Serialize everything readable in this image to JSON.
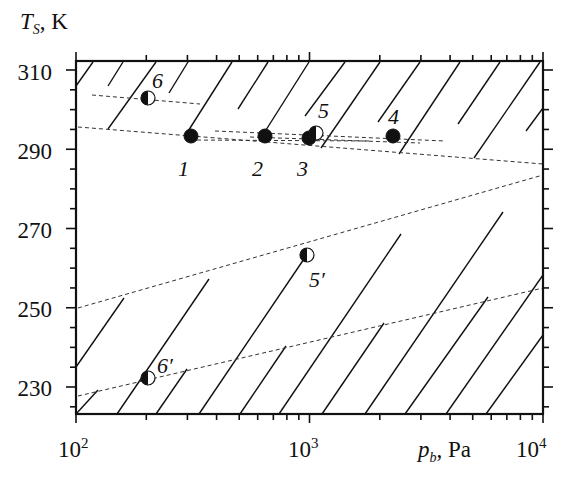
{
  "chart_data": {
    "type": "scatter",
    "title": "",
    "xlabel": "p_b, Pa",
    "xlabel_main": "p",
    "xlabel_sub": "b",
    "xlabel_unit": ", Pa",
    "ylabel": "T_S, K",
    "ylabel_main": "T",
    "ylabel_sub": "S",
    "ylabel_unit": ", K",
    "xscale": "log",
    "xlim": [
      100,
      10000
    ],
    "ylim": [
      223,
      313
    ],
    "x_ticks": [
      {
        "base": "10",
        "exp": "2",
        "value": 100
      },
      {
        "base": "10",
        "exp": "3",
        "value": 1000
      },
      {
        "base": "10",
        "exp": "4",
        "value": 10000
      }
    ],
    "y_ticks": [
      "230",
      "250",
      "270",
      "290",
      "310"
    ],
    "grid": false,
    "legend": null,
    "points": [
      {
        "label": "1",
        "p": 310,
        "T": 293.3,
        "marker": "filled"
      },
      {
        "label": "2",
        "p": 650,
        "T": 293.3,
        "marker": "filled"
      },
      {
        "label": "3",
        "p": 990,
        "T": 293.0,
        "marker": "filled"
      },
      {
        "label": "4",
        "p": 2300,
        "T": 293.3,
        "marker": "filled"
      },
      {
        "label": "5",
        "p": 1070,
        "T": 294.3,
        "marker": "half"
      },
      {
        "label": "6",
        "p": 200,
        "T": 303.6,
        "marker": "half"
      },
      {
        "label": "5′",
        "p": 1000,
        "T": 262.8,
        "marker": "half"
      },
      {
        "label": "6′",
        "p": 200,
        "T": 232.4,
        "marker": "half"
      }
    ],
    "dashed_lines": [
      {
        "name": "upper-boundary",
        "from": {
          "p": 100,
          "T": 297.5
        },
        "to": {
          "p": 10000,
          "T": 288.1
        }
      },
      {
        "name": "line-through-6",
        "from": {
          "p": 115,
          "T": 304.1
        },
        "to": {
          "p": 330,
          "T": 301.8
        }
      },
      {
        "name": "points-1-4-fit-a",
        "from": {
          "p": 530,
          "T": 294.6
        },
        "to": {
          "p": 3000,
          "T": 292.0
        }
      },
      {
        "name": "points-1-4-fit-b",
        "from": {
          "p": 195,
          "T": 293.6
        },
        "to": {
          "p": 1500,
          "T": 291.5
        }
      },
      {
        "name": "line-through-5prime",
        "from": {
          "p": 100,
          "T": 250.1
        },
        "to": {
          "p": 10000,
          "T": 277.1
        }
      },
      {
        "name": "line-through-6prime",
        "from": {
          "p": 100,
          "T": 227.6
        },
        "to": {
          "p": 10000,
          "T": 255.2
        }
      }
    ],
    "hatched_regions": [
      "above upper-boundary line",
      "below line-through-5prime"
    ]
  },
  "layout": {
    "plot_px": {
      "left": 76,
      "right": 543,
      "top": 61,
      "bottom": 414
    },
    "y_px": {
      "310": 70,
      "290": 149,
      "270": 229,
      "250": 308,
      "230": 387
    }
  },
  "hatch_segments_px": [
    [
      76,
      86,
      93,
      62
    ],
    [
      108,
      86,
      123,
      62
    ],
    [
      108,
      129,
      156,
      62
    ],
    [
      169,
      93,
      188,
      62
    ],
    [
      185,
      136,
      232,
      62
    ],
    [
      238,
      109,
      268,
      62
    ],
    [
      259,
      141,
      309,
      62
    ],
    [
      305,
      116,
      345,
      62
    ],
    [
      321,
      148,
      380,
      62
    ],
    [
      378,
      122,
      420,
      62
    ],
    [
      399,
      154,
      460,
      62
    ],
    [
      458,
      124,
      500,
      62
    ],
    [
      474,
      158,
      540,
      62
    ],
    [
      526,
      131,
      543,
      108
    ],
    [
      76,
      367,
      124,
      298
    ],
    [
      76,
      414,
      98,
      390
    ],
    [
      117,
      414,
      209,
      279
    ],
    [
      156,
      414,
      187,
      369
    ],
    [
      199,
      414,
      306,
      256
    ],
    [
      240,
      414,
      286,
      346
    ],
    [
      279,
      414,
      401,
      234
    ],
    [
      322,
      414,
      384,
      323
    ],
    [
      365,
      414,
      503,
      212
    ],
    [
      405,
      414,
      488,
      297
    ],
    [
      446,
      414,
      543,
      275
    ],
    [
      486,
      414,
      543,
      335
    ]
  ],
  "dash_segments_px": [
    [
      78,
      127,
      543,
      164
    ],
    [
      92,
      95,
      200,
      104
    ],
    [
      215,
      131,
      445,
      141
    ],
    [
      190,
      140,
      370,
      141
    ],
    [
      250,
      137,
      420,
      143
    ],
    [
      78,
      308,
      543,
      175
    ],
    [
      78,
      396,
      543,
      288
    ]
  ],
  "point_px": [
    {
      "label": "1",
      "x": 191,
      "y": 136,
      "marker": "filled",
      "lx": 178,
      "ly": 176
    },
    {
      "label": "2",
      "x": 265,
      "y": 136,
      "marker": "filled",
      "lx": 252,
      "ly": 176
    },
    {
      "label": "3",
      "x": 309,
      "y": 138,
      "marker": "filled",
      "lx": 297,
      "ly": 176
    },
    {
      "label": "5",
      "x": 316,
      "y": 133,
      "marker": "half",
      "lx": 318,
      "ly": 118
    },
    {
      "label": "4",
      "x": 393,
      "y": 136,
      "marker": "filled",
      "lx": 388,
      "ly": 124
    },
    {
      "label": "6",
      "x": 148,
      "y": 98,
      "marker": "half",
      "lx": 152,
      "ly": 88
    },
    {
      "label": "5′",
      "x": 307,
      "y": 255,
      "marker": "half",
      "lx": 309,
      "ly": 287
    },
    {
      "label": "6′",
      "x": 148,
      "y": 378,
      "marker": "half",
      "lx": 157,
      "ly": 373
    }
  ]
}
